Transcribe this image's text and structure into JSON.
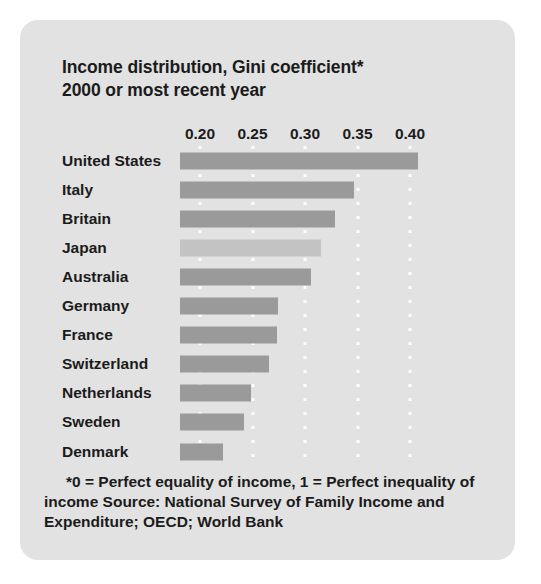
{
  "chart_data": {
    "type": "bar",
    "orientation": "horizontal",
    "title": "Income distribution, Gini coefficient*",
    "subtitle": "2000 or most recent year",
    "title_lines": [
      "Income distribution, Gini coefficient*",
      "2000 or most recent year"
    ],
    "xlabel": "",
    "ylabel": "",
    "xlim": [
      0.18,
      0.42
    ],
    "axis_ticks": [
      0.2,
      0.25,
      0.3,
      0.35,
      0.4
    ],
    "tick_labels": [
      "0.20",
      "0.25",
      "0.30",
      "0.35",
      "0.40"
    ],
    "grid": "vertical-dotted",
    "legend": "none",
    "bar_origin": 0.181,
    "categories": [
      "United States",
      "Italy",
      "Britain",
      "Japan",
      "Australia",
      "Germany",
      "France",
      "Switzerland",
      "Netherlands",
      "Sweden",
      "Denmark"
    ],
    "values": [
      0.408,
      0.347,
      0.329,
      0.315,
      0.306,
      0.274,
      0.273,
      0.266,
      0.249,
      0.242,
      0.222
    ],
    "bars": [
      {
        "label": "United States",
        "value": 0.408,
        "highlight": false
      },
      {
        "label": "Italy",
        "value": 0.347,
        "highlight": false
      },
      {
        "label": "Britain",
        "value": 0.329,
        "highlight": false
      },
      {
        "label": "Japan",
        "value": 0.315,
        "highlight": true
      },
      {
        "label": "Australia",
        "value": 0.306,
        "highlight": false
      },
      {
        "label": "Germany",
        "value": 0.274,
        "highlight": false
      },
      {
        "label": "France",
        "value": 0.273,
        "highlight": false
      },
      {
        "label": "Switzerland",
        "value": 0.266,
        "highlight": false
      },
      {
        "label": "Netherlands",
        "value": 0.249,
        "highlight": false
      },
      {
        "label": "Sweden",
        "value": 0.242,
        "highlight": false
      },
      {
        "label": "Denmark",
        "value": 0.222,
        "highlight": false
      }
    ],
    "annotation": "*0 = Perfect equality of income, 1 = Perfect inequality of income Source: National Survey of Family Income and Expenditure; OECD; World Bank",
    "colors": {
      "background": "#e2e2e2",
      "page": "#ffffff",
      "bar": "#9a9a9a",
      "bar_highlight": "#c3c3c3",
      "text": "#1b1b1b",
      "gridline": "#ffffff"
    }
  },
  "footnote": "*0 = Perfect equality of income, 1 = Perfect inequality of income Source: National Survey of Family Income and Expenditure; OECD; World Bank"
}
